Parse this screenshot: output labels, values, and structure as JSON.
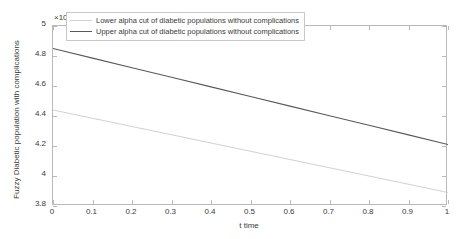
{
  "chart_data": {
    "type": "line",
    "title": "",
    "subtitle": "",
    "xlabel": "t time",
    "ylabel": "Fuzzy Diabetic population with complications",
    "y_exponent_label": "×10",
    "y_exponent_power": "7",
    "y_scale_factor": 10000000.0,
    "xlim": [
      0,
      1
    ],
    "ylim": [
      3.8,
      5
    ],
    "xticks": [
      0,
      0.1,
      0.2,
      0.3,
      0.4,
      0.5,
      0.6,
      0.7,
      0.8,
      0.9,
      1
    ],
    "xticklabels": [
      "0",
      "0.1",
      "0.2",
      "0.3",
      "0.4",
      "0.5",
      "0.6",
      "0.7",
      "0.8",
      "0.9",
      "1"
    ],
    "yticks": [
      3.8,
      4,
      4.2,
      4.4,
      4.6,
      4.8,
      5
    ],
    "yticklabels": [
      "3.8",
      "4",
      "4.2",
      "4.4",
      "4.6",
      "4.8",
      "5"
    ],
    "grid": false,
    "legend_position": "upper center",
    "x": [
      0,
      0.1,
      0.2,
      0.3,
      0.4,
      0.5,
      0.6,
      0.7,
      0.8,
      0.9,
      1
    ],
    "series": [
      {
        "name": "Lower alpha cut of diabetic populations without complications",
        "color": "#d2d2d2",
        "values": [
          4.44,
          4.385,
          4.33,
          4.275,
          4.22,
          4.165,
          4.11,
          4.055,
          4.0,
          3.945,
          3.89
        ]
      },
      {
        "name": "Upper alpha cut of diabetic populations without complications",
        "color": "#5a5a5a",
        "values": [
          4.85,
          4.786,
          4.722,
          4.658,
          4.594,
          4.53,
          4.466,
          4.402,
          4.338,
          4.274,
          4.21
        ]
      }
    ]
  },
  "legend": {
    "entries": [
      {
        "label": "Lower alpha cut of diabetic populations without complications"
      },
      {
        "label": "Upper alpha cut of diabetic populations without complications"
      }
    ]
  },
  "axes": {
    "x_title": "t time",
    "y_title": "Fuzzy Diabetic population with complications",
    "exponent_prefix": "×10",
    "exponent_power": "7"
  }
}
